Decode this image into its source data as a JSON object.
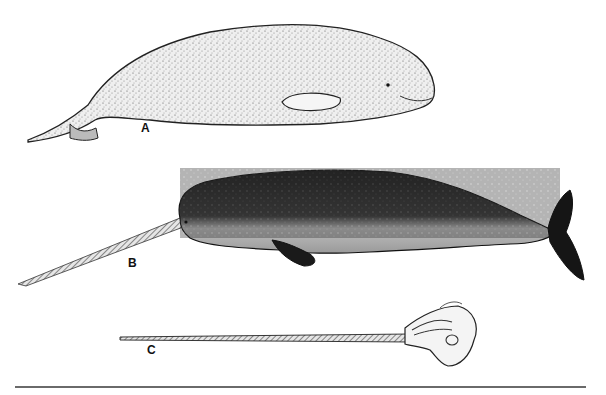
{
  "figure": {
    "panels": [
      {
        "label": "A",
        "subject": "beluga whale illustration"
      },
      {
        "label": "B",
        "subject": "narwhal with tusk illustration"
      },
      {
        "label": "C",
        "subject": "narwhal skull with tusk illustration"
      }
    ],
    "colors": {
      "background": "#ffffff",
      "ink": "#111111",
      "beluga_fill": "#e9e9e9",
      "narwhal_dark": "#262626",
      "narwhal_belly": "#d8d8d8",
      "rule": "#6a6a6a"
    }
  }
}
